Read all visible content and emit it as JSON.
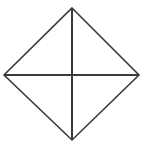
{
  "figure": {
    "name": "rhombus-with-diagonals",
    "background_color": "#ffffff",
    "stroke_color": "#3a3a3a",
    "outline_stroke_width": 1.6,
    "diagonal_stroke_width": 2.0,
    "canvas": {
      "width": 144,
      "height": 148
    },
    "vertices": {
      "top": {
        "label": "top",
        "x": 72,
        "y": 8
      },
      "right": {
        "label": "right",
        "x": 139,
        "y": 75
      },
      "bottom": {
        "label": "bottom",
        "x": 72,
        "y": 140
      },
      "left": {
        "label": "left",
        "x": 4,
        "y": 75
      },
      "center": {
        "label": "center",
        "x": 72,
        "y": 75
      }
    },
    "outline_path": "M 72 8 L 139 75 L 72 140 L 4 75 Z",
    "vertical_diagonal_path": "M 72 8 L 72 140",
    "horizontal_diagonal_path": "M 4 75 L 139 75",
    "labels": []
  }
}
